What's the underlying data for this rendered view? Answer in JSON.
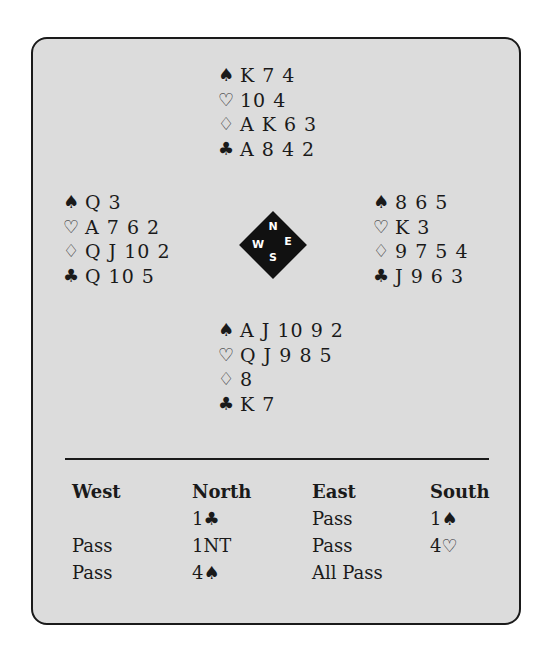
{
  "diagram": {
    "hands": {
      "north": {
        "spades": "K 7 4",
        "hearts": "10 4",
        "diamonds": "A K 6 3",
        "clubs": "A 8 4 2"
      },
      "west": {
        "spades": "Q 3",
        "hearts": "A 7 6 2",
        "diamonds": "Q J 10 2",
        "clubs": "Q 10 5"
      },
      "east": {
        "spades": "8 6 5",
        "hearts": "K 3",
        "diamonds": "9 7 5 4",
        "clubs": "J 9 6 3"
      },
      "south": {
        "spades": "A J 10 9 2",
        "hearts": "Q J 9 8 5",
        "diamonds": "8",
        "clubs": "K 7"
      }
    },
    "suit_symbols": {
      "spades": "♠",
      "hearts": "♡",
      "diamonds": "♢",
      "clubs": "♣"
    },
    "compass": {
      "n": "N",
      "e": "E",
      "s": "S",
      "w": "W"
    }
  },
  "auction": {
    "headers": [
      "West",
      "North",
      "East",
      "South"
    ],
    "rows": [
      [
        "",
        "1♣",
        "Pass",
        "1♠"
      ],
      [
        "Pass",
        "1NT",
        "Pass",
        "4♡"
      ],
      [
        "Pass",
        "4♠",
        "All Pass",
        ""
      ]
    ]
  }
}
